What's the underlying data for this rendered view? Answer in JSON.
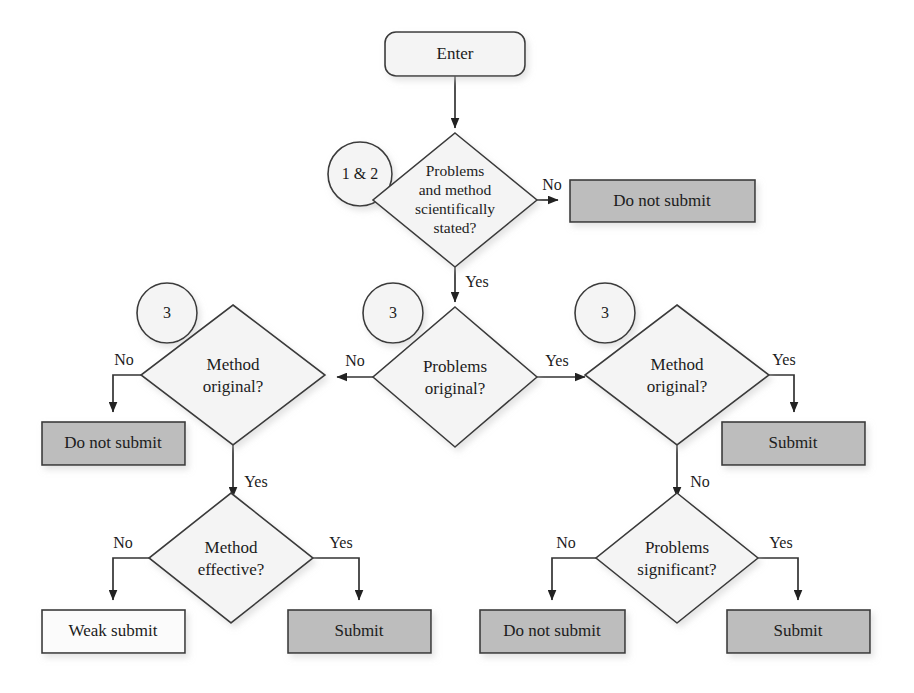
{
  "diagram": {
    "type": "flowchart",
    "colors": {
      "stroke": "#3a3a3a",
      "edge": "#333333",
      "gray_fill": "#bdbdbd",
      "light_fill": "#f4f4f4",
      "white_fill": "#fbfbfb",
      "text": "#1c1c1c",
      "background": "#ffffff"
    },
    "nodes": {
      "enter": {
        "label": "Enter",
        "shape": "rounded-rect",
        "fill": "light"
      },
      "annot_1_2": {
        "label": "1 & 2",
        "shape": "circle",
        "fill": "light"
      },
      "annot_3_left": {
        "label": "3",
        "shape": "circle",
        "fill": "light"
      },
      "annot_3_mid": {
        "label": "3",
        "shape": "circle",
        "fill": "light"
      },
      "annot_3_right": {
        "label": "3",
        "shape": "circle",
        "fill": "light"
      },
      "d_scientific": {
        "label_lines": [
          "Problems",
          "and method",
          "scientifically",
          "stated?"
        ],
        "shape": "diamond",
        "fill": "light"
      },
      "t_do_not_submit_top": {
        "label": "Do not submit",
        "shape": "rect",
        "fill": "gray"
      },
      "d_problems_original": {
        "label_lines": [
          "Problems",
          "original?"
        ],
        "shape": "diamond",
        "fill": "light"
      },
      "d_method_original_left": {
        "label_lines": [
          "Method",
          "original?"
        ],
        "shape": "diamond",
        "fill": "light"
      },
      "d_method_original_right": {
        "label_lines": [
          "Method",
          "original?"
        ],
        "shape": "diamond",
        "fill": "light"
      },
      "t_do_not_submit_left": {
        "label": "Do not submit",
        "shape": "rect",
        "fill": "gray"
      },
      "t_submit_right": {
        "label": "Submit",
        "shape": "rect",
        "fill": "gray"
      },
      "d_method_effective": {
        "label_lines": [
          "Method",
          "effective?"
        ],
        "shape": "diamond",
        "fill": "light"
      },
      "d_problems_significant": {
        "label_lines": [
          "Problems",
          "significant?"
        ],
        "shape": "diamond",
        "fill": "light"
      },
      "t_weak_submit": {
        "label": "Weak submit",
        "shape": "rect",
        "fill": "white"
      },
      "t_submit_bottom_left": {
        "label": "Submit",
        "shape": "rect",
        "fill": "gray"
      },
      "t_do_not_submit_bottom": {
        "label": "Do not submit",
        "shape": "rect",
        "fill": "gray"
      },
      "t_submit_bottom_right": {
        "label": "Submit",
        "shape": "rect",
        "fill": "gray"
      }
    },
    "edge_labels": {
      "scientific_no": "No",
      "scientific_yes": "Yes",
      "problems_original_no": "No",
      "problems_original_yes": "Yes",
      "method_original_left_no": "No",
      "method_original_left_yes": "Yes",
      "method_original_right_yes": "Yes",
      "method_original_right_no": "No",
      "method_effective_no": "No",
      "method_effective_yes": "Yes",
      "problems_significant_no": "No",
      "problems_significant_yes": "Yes"
    }
  }
}
